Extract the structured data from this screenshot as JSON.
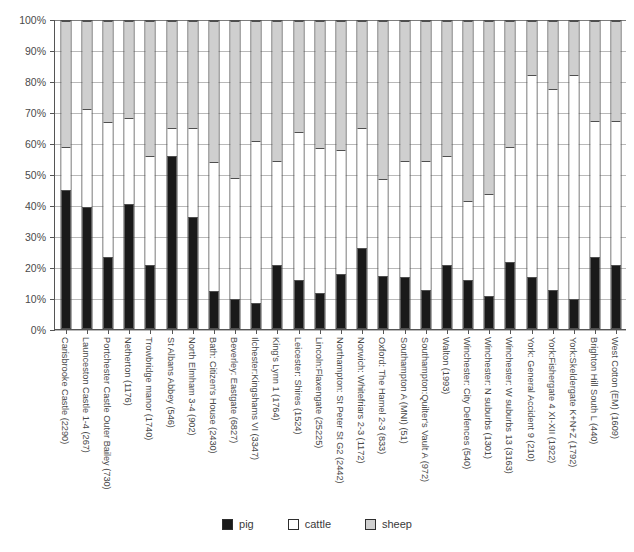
{
  "chart_data": {
    "type": "bar",
    "subtype": "stacked-100-percent",
    "title": "",
    "xlabel": "",
    "ylabel": "",
    "ylim": [
      0,
      100
    ],
    "ytick_labels": [
      "0%",
      "10%",
      "20%",
      "30%",
      "40%",
      "50%",
      "60%",
      "70%",
      "80%",
      "90%",
      "100%"
    ],
    "ytick_values": [
      0,
      10,
      20,
      30,
      40,
      50,
      60,
      70,
      80,
      90,
      100
    ],
    "grid": true,
    "legend_position": "bottom",
    "legend": [
      "pig",
      "cattle",
      "sheep"
    ],
    "colors": {
      "pig": "#1a1a1a",
      "cattle": "#ffffff",
      "sheep": "#cfcfcf",
      "outline": "#4f4f4f",
      "gridline": "#b9b9b9",
      "axis": "#555555",
      "text": "#4a4a4a"
    },
    "categories": [
      "Carisbrooke Castle (2290)",
      "Launceston Castle 1-4 (267)",
      "Portchester Castle Outer Bailey (730)",
      "Netherton (1176)",
      "Trowbridge manor (1740)",
      "St Albans Abbey (546)",
      "North Elmham 3-4 (902)",
      "Bath: Citizen's House (2430)",
      "Beverley: Eastgate (6827)",
      "Ilchester:Kingshams VI (3347)",
      "King's Lynn 1 (1764)",
      "Leicester: Shires (1524)",
      "Lincoln:Flaxengate (25225)",
      "Northampton: St Peter St G2 (2442)",
      "Norwich: Whitefriars 2-3 (1172)",
      "Oxford: The Hamel 2-3 (833)",
      "Southampton A (MNI) (51)",
      "Southampton:Quilter's Vault A (972)",
      "Walton (1993)",
      "Winchester: City Defences (540)",
      "Winchester: N suburbs (1301)",
      "Winchester: W suburbs 13 (3163)",
      "York: General Accident 9 (210)",
      "York:Fishergate 4 XI-XII (1922)",
      "York:Skeldergate K+N+Z (1792)",
      "Brighton Hill South L (440)",
      "West Cotton (EM) (1609)"
    ],
    "series": [
      {
        "name": "pig",
        "values": [
          45,
          39.5,
          23,
          40.5,
          20.5,
          56,
          36,
          12,
          9.5,
          8,
          20.5,
          15.5,
          11.5,
          17.5,
          26,
          17,
          16.5,
          12.5,
          20.5,
          15.5,
          10.5,
          21.5,
          16.5,
          12.5,
          9.5,
          23,
          20.5
        ]
      },
      {
        "name": "cattle",
        "values": [
          14,
          32,
          44,
          28,
          35.5,
          9,
          29,
          42,
          39.5,
          53,
          34,
          48.5,
          47,
          40.5,
          39,
          31.5,
          38,
          42,
          35.5,
          26,
          33,
          37.5,
          66,
          65.5,
          73,
          44.5,
          47
        ]
      },
      {
        "name": "sheep",
        "values": [
          41,
          28.5,
          33,
          31.5,
          44,
          35,
          35,
          46,
          51,
          39,
          45.5,
          36,
          41.5,
          42,
          35,
          51.5,
          45.5,
          45.5,
          44,
          58.5,
          56.5,
          41,
          17.5,
          22,
          17.5,
          32.5,
          32.5
        ]
      }
    ]
  }
}
